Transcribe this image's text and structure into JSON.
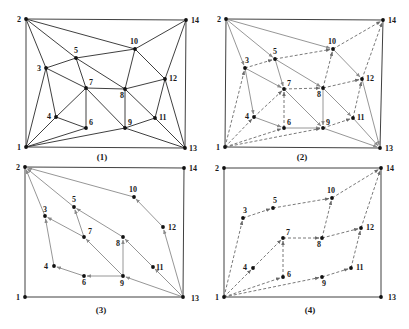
{
  "figure": {
    "colors": {
      "boundary": "#2a2a2a",
      "solid_edge": "#2a2a2a",
      "gray_edge": "#8a8a8a",
      "dashed_edge": "#6a6a6a",
      "node": "#111111",
      "label": "#1a1a1a"
    },
    "panels": [
      {
        "id": "1",
        "caption": "(1)",
        "caption_pos": [
          102,
          160
        ],
        "nodes": {
          "1": [
            26,
            147
          ],
          "2": [
            26,
            19
          ],
          "3": [
            46,
            68
          ],
          "4": [
            56,
            117
          ],
          "5": [
            76,
            58
          ],
          "6": [
            86,
            128
          ],
          "7": [
            86,
            88
          ],
          "8": [
            125,
            89
          ],
          "9": [
            125,
            128
          ],
          "10": [
            135,
            49
          ],
          "11": [
            155,
            118
          ],
          "12": [
            165,
            79
          ],
          "13": [
            185,
            148
          ],
          "14": [
            186,
            20
          ]
        },
        "labels": {
          "1": [
            -9,
            3
          ],
          "2": [
            -9,
            3
          ],
          "3": [
            -9,
            3
          ],
          "4": [
            -9,
            2
          ],
          "5": [
            -2,
            -5
          ],
          "6": [
            3,
            -3
          ],
          "7": [
            3,
            -3
          ],
          "8": [
            -5,
            9
          ],
          "9": [
            3,
            -3
          ],
          "10": [
            -5,
            -5
          ],
          "11": [
            4,
            2
          ],
          "12": [
            4,
            2
          ],
          "13": [
            4,
            3
          ],
          "14": [
            5,
            3
          ]
        },
        "solid_edges": [
          [
            "1",
            "2"
          ],
          [
            "2",
            "14"
          ],
          [
            "14",
            "13"
          ],
          [
            "13",
            "1"
          ],
          [
            "2",
            "3"
          ],
          [
            "2",
            "5"
          ],
          [
            "2",
            "10"
          ],
          [
            "3",
            "5"
          ],
          [
            "5",
            "10"
          ],
          [
            "10",
            "14"
          ],
          [
            "10",
            "12"
          ],
          [
            "12",
            "14"
          ],
          [
            "12",
            "13"
          ],
          [
            "1",
            "3"
          ],
          [
            "1",
            "4"
          ],
          [
            "3",
            "4"
          ],
          [
            "3",
            "7"
          ],
          [
            "5",
            "7"
          ],
          [
            "5",
            "8"
          ],
          [
            "4",
            "7"
          ],
          [
            "4",
            "6"
          ],
          [
            "6",
            "7"
          ],
          [
            "7",
            "8"
          ],
          [
            "7",
            "9"
          ],
          [
            "8",
            "9"
          ],
          [
            "8",
            "10"
          ],
          [
            "8",
            "12"
          ],
          [
            "8",
            "11"
          ],
          [
            "9",
            "11"
          ],
          [
            "11",
            "12"
          ],
          [
            "11",
            "13"
          ],
          [
            "9",
            "13"
          ],
          [
            "1",
            "6"
          ],
          [
            "1",
            "9"
          ]
        ],
        "gray_edges": [],
        "dashed_edges": []
      },
      {
        "id": "2",
        "caption": "(2)",
        "caption_pos": [
          302,
          160
        ],
        "nodes": {
          "1": [
            225,
            147
          ],
          "2": [
            226,
            19
          ],
          "3": [
            245,
            68
          ],
          "4": [
            254,
            117
          ],
          "5": [
            275,
            59
          ],
          "6": [
            284,
            128
          ],
          "7": [
            284,
            89
          ],
          "8": [
            323,
            88
          ],
          "9": [
            323,
            128
          ],
          "10": [
            333,
            49
          ],
          "11": [
            353,
            118
          ],
          "12": [
            362,
            79
          ],
          "13": [
            380,
            148
          ],
          "14": [
            383,
            20
          ]
        },
        "labels": {
          "1": [
            -9,
            3
          ],
          "2": [
            -9,
            3
          ],
          "3": [
            0,
            -5
          ],
          "4": [
            -9,
            2
          ],
          "5": [
            -2,
            -5
          ],
          "6": [
            3,
            -3
          ],
          "7": [
            3,
            -3
          ],
          "8": [
            -6,
            9
          ],
          "9": [
            3,
            -3
          ],
          "10": [
            -5,
            -5
          ],
          "11": [
            4,
            2
          ],
          "12": [
            4,
            2
          ],
          "13": [
            5,
            3
          ],
          "14": [
            5,
            3
          ]
        },
        "solid_edges": [
          [
            "1",
            "2"
          ],
          [
            "2",
            "14"
          ],
          [
            "14",
            "13"
          ],
          [
            "13",
            "1"
          ]
        ],
        "gray_edges": [
          [
            "2",
            "3"
          ],
          [
            "2",
            "5"
          ],
          [
            "2",
            "10"
          ],
          [
            "3",
            "7"
          ],
          [
            "5",
            "7"
          ],
          [
            "5",
            "8"
          ],
          [
            "7",
            "9"
          ],
          [
            "8",
            "9"
          ],
          [
            "8",
            "11"
          ],
          [
            "10",
            "12"
          ],
          [
            "11",
            "13"
          ],
          [
            "12",
            "13"
          ],
          [
            "9",
            "13"
          ],
          [
            "4",
            "6"
          ],
          [
            "6",
            "9"
          ],
          [
            "3",
            "4"
          ]
        ],
        "dashed_edges": [
          [
            "1",
            "3"
          ],
          [
            "1",
            "4"
          ],
          [
            "1",
            "6"
          ],
          [
            "1",
            "9"
          ],
          [
            "3",
            "5"
          ],
          [
            "4",
            "7"
          ],
          [
            "6",
            "7"
          ],
          [
            "7",
            "8"
          ],
          [
            "8",
            "10"
          ],
          [
            "8",
            "12"
          ],
          [
            "9",
            "11"
          ],
          [
            "11",
            "12"
          ],
          [
            "10",
            "14"
          ],
          [
            "12",
            "14"
          ],
          [
            "5",
            "10"
          ]
        ]
      },
      {
        "id": "3",
        "caption": "(3)",
        "caption_pos": [
          101,
          313
        ],
        "nodes": {
          "1": [
            25,
            297
          ],
          "2": [
            25,
            167
          ],
          "3": [
            45,
            216
          ],
          "4": [
            54,
            266
          ],
          "5": [
            74,
            207
          ],
          "6": [
            84,
            276
          ],
          "7": [
            84,
            237
          ],
          "8": [
            123,
            237
          ],
          "9": [
            123,
            276
          ],
          "10": [
            134,
            197
          ],
          "11": [
            153,
            267
          ],
          "12": [
            163,
            227
          ],
          "13": [
            183,
            297
          ],
          "14": [
            184,
            168
          ]
        },
        "labels": {
          "1": [
            -9,
            3
          ],
          "2": [
            -9,
            3
          ],
          "3": [
            -2,
            -4
          ],
          "4": [
            -10,
            3
          ],
          "5": [
            -2,
            -5
          ],
          "6": [
            -2,
            9
          ],
          "7": [
            4,
            -3
          ],
          "8": [
            -7,
            9
          ],
          "9": [
            -3,
            10
          ],
          "10": [
            -5,
            -5
          ],
          "11": [
            3,
            3
          ],
          "12": [
            5,
            3
          ],
          "13": [
            8,
            4
          ],
          "14": [
            5,
            3
          ]
        },
        "solid_edges": [
          [
            "1",
            "2"
          ],
          [
            "2",
            "14"
          ],
          [
            "14",
            "13"
          ],
          [
            "13",
            "1"
          ]
        ],
        "gray_edges": [
          [
            "13",
            "9"
          ],
          [
            "13",
            "11"
          ],
          [
            "13",
            "12"
          ],
          [
            "12",
            "10"
          ],
          [
            "10",
            "2"
          ],
          [
            "11",
            "8"
          ],
          [
            "8",
            "5"
          ],
          [
            "5",
            "2"
          ],
          [
            "9",
            "8"
          ],
          [
            "9",
            "7"
          ],
          [
            "7",
            "3"
          ],
          [
            "7",
            "5"
          ],
          [
            "3",
            "2"
          ],
          [
            "9",
            "6"
          ],
          [
            "6",
            "4"
          ],
          [
            "4",
            "3"
          ]
        ],
        "dashed_edges": []
      },
      {
        "id": "4",
        "caption": "(4)",
        "caption_pos": [
          310,
          313
        ],
        "nodes": {
          "1": [
            224,
            297
          ],
          "2": [
            224,
            168
          ],
          "3": [
            243,
            218
          ],
          "4": [
            253,
            268
          ],
          "5": [
            273,
            208
          ],
          "6": [
            283,
            277
          ],
          "7": [
            283,
            238
          ],
          "8": [
            322,
            238
          ],
          "9": [
            322,
            277
          ],
          "10": [
            332,
            198
          ],
          "11": [
            351,
            268
          ],
          "12": [
            361,
            228
          ],
          "13": [
            381,
            297
          ],
          "14": [
            381,
            168
          ]
        },
        "labels": {
          "1": [
            -9,
            3
          ],
          "2": [
            -9,
            3
          ],
          "3": [
            0,
            -5
          ],
          "4": [
            -10,
            2
          ],
          "5": [
            0,
            -5
          ],
          "6": [
            4,
            0
          ],
          "7": [
            3,
            -3
          ],
          "8": [
            -5,
            9
          ],
          "9": [
            0,
            9
          ],
          "10": [
            -5,
            -5
          ],
          "11": [
            5,
            2
          ],
          "12": [
            5,
            2
          ],
          "13": [
            7,
            3
          ],
          "14": [
            5,
            3
          ]
        },
        "solid_edges": [
          [
            "1",
            "2"
          ],
          [
            "2",
            "14"
          ],
          [
            "14",
            "13"
          ],
          [
            "13",
            "1"
          ]
        ],
        "gray_edges": [],
        "dashed_edges": [
          [
            "1",
            "3"
          ],
          [
            "3",
            "5"
          ],
          [
            "5",
            "10"
          ],
          [
            "10",
            "14"
          ],
          [
            "1",
            "4"
          ],
          [
            "4",
            "7"
          ],
          [
            "7",
            "8"
          ],
          [
            "8",
            "10"
          ],
          [
            "8",
            "12"
          ],
          [
            "12",
            "14"
          ],
          [
            "1",
            "6"
          ],
          [
            "6",
            "7"
          ],
          [
            "1",
            "9"
          ],
          [
            "9",
            "11"
          ],
          [
            "11",
            "12"
          ]
        ]
      }
    ]
  }
}
